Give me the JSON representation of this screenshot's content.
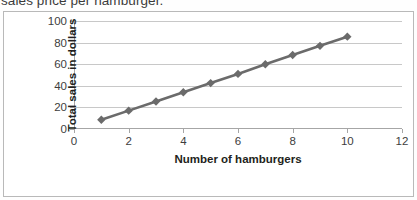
{
  "caption": {
    "text": "sales price per hamburger."
  },
  "chart_data": {
    "type": "line",
    "title": "",
    "xlabel": "Number of hamburgers",
    "ylabel": "Total sales in dollars",
    "xlim": [
      0,
      12
    ],
    "ylim": [
      0,
      100
    ],
    "xticks": [
      0,
      2,
      4,
      6,
      8,
      10,
      12
    ],
    "yticks": [
      0,
      20,
      40,
      60,
      80,
      100
    ],
    "grid": "horizontal",
    "legend": "none",
    "marker": "diamond",
    "series": [
      {
        "name": "Total sales",
        "color": "#6b6b6b",
        "x": [
          1,
          2,
          3,
          4,
          5,
          6,
          7,
          8,
          9,
          10
        ],
        "values": [
          8.5,
          17,
          25.5,
          34,
          42.5,
          51,
          60,
          68.5,
          77,
          85.5
        ]
      }
    ]
  }
}
